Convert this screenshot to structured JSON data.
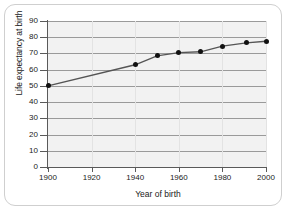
{
  "chart_data": {
    "type": "line",
    "title": "",
    "xlabel": "Year of birth",
    "ylabel": "Life expectancy at birth",
    "xlim": [
      1900,
      2000
    ],
    "ylim": [
      0,
      90
    ],
    "grid": "horizontal",
    "legend": "none",
    "marker": "filled-circle",
    "line_color": "#555555",
    "marker_color": "#111111",
    "plot_background": "#f2f2f2",
    "xticks": [
      1900,
      1920,
      1940,
      1960,
      1980,
      2000
    ],
    "xticklabels": [
      "1900",
      "1920",
      "1940",
      "1960",
      "1980",
      "2000"
    ],
    "yticks": [
      0,
      10,
      20,
      30,
      40,
      50,
      60,
      70,
      80,
      90
    ],
    "yticklabels": [
      "0",
      "10",
      "20",
      "30",
      "40",
      "50",
      "60",
      "70",
      "80",
      "90"
    ],
    "x": [
      1900,
      1940,
      1950,
      1960,
      1970,
      1980,
      1991,
      2000
    ],
    "values": [
      50,
      63,
      68.5,
      70.5,
      71,
      74.5,
      76.5,
      77.5
    ],
    "series": [
      {
        "name": "Life expectancy at birth",
        "x": [
          1900,
          1940,
          1950,
          1960,
          1970,
          1980,
          1991,
          2000
        ],
        "values": [
          50,
          63,
          68.5,
          70.5,
          71,
          74.5,
          76.5,
          77.5
        ]
      }
    ]
  }
}
